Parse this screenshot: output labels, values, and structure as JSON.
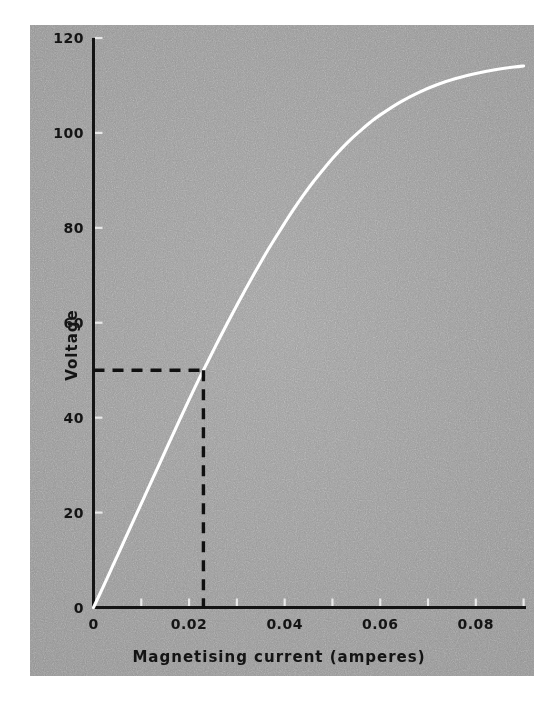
{
  "figure": {
    "background_color": "#ffffff",
    "plate_color": "#9a9a9a",
    "curve_color": "#ffffff",
    "axis_color": "#141414",
    "dashed_color": "#101010"
  },
  "chart_data": {
    "type": "line",
    "title": "",
    "xlabel": "Magnetising current (amperes)",
    "ylabel": "Voltage",
    "xlim": [
      0,
      0.0905
    ],
    "ylim": [
      0,
      120
    ],
    "grid": false,
    "legend": null,
    "x_ticks": [
      0,
      0.02,
      0.04,
      0.06,
      0.08
    ],
    "x_tick_labels": [
      "0",
      "0.02",
      "0.04",
      "0.06",
      "0.08"
    ],
    "x_minor_ticks": [
      0.01,
      0.03,
      0.05,
      0.07,
      0.09
    ],
    "y_ticks": [
      0,
      20,
      40,
      60,
      80,
      100,
      120
    ],
    "y_tick_labels": [
      "0",
      "20",
      "40",
      "60",
      "80",
      "100",
      "120"
    ],
    "series": [
      {
        "name": "Open-circuit magnetisation characteristic",
        "color": "#ffffff",
        "style": "solid",
        "x": [
          0.0,
          0.002,
          0.004,
          0.006,
          0.008,
          0.01,
          0.012,
          0.014,
          0.016,
          0.018,
          0.02,
          0.022,
          0.023,
          0.024,
          0.026,
          0.028,
          0.03,
          0.032,
          0.034,
          0.036,
          0.038,
          0.04,
          0.042,
          0.044,
          0.046,
          0.048,
          0.05,
          0.052,
          0.054,
          0.056,
          0.058,
          0.06,
          0.064,
          0.068,
          0.072,
          0.076,
          0.08,
          0.084,
          0.088,
          0.09
        ],
        "y": [
          0.0,
          4.3,
          8.7,
          13.1,
          17.5,
          21.9,
          26.3,
          30.7,
          35.1,
          39.5,
          43.8,
          48.0,
          50.0,
          52.0,
          56.0,
          59.9,
          63.7,
          67.4,
          71.0,
          74.5,
          77.8,
          81.0,
          84.1,
          87.0,
          89.7,
          92.2,
          94.6,
          96.8,
          98.8,
          100.6,
          102.3,
          103.8,
          106.4,
          108.5,
          110.2,
          111.5,
          112.5,
          113.3,
          113.9,
          114.1
        ]
      }
    ],
    "annotations": [
      {
        "name": "construction-lines",
        "style": "dashed",
        "color": "#101010",
        "point": {
          "x": 0.023,
          "y": 50
        },
        "description": "Dashed horizontal line from the voltage axis at 50 V to the curve, and a dashed vertical line dropping from that intersection to the current axis at 0.023 A"
      }
    ]
  },
  "axes": {
    "y_title": "Voltage",
    "x_title": "Magnetising current (amperes)"
  }
}
